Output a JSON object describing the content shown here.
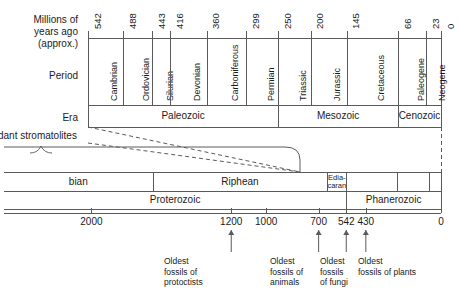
{
  "figure": {
    "type": "geologic-time-scale",
    "axis_label_lines": [
      "Millions of",
      "years ago",
      "(approx.)"
    ],
    "row_labels": {
      "period": "Period",
      "era": "Era"
    },
    "caption_left": "dant stromatolites"
  },
  "phanerozoic_scale": {
    "tick_values": [
      542,
      488,
      443,
      416,
      360,
      299,
      250,
      200,
      145,
      66,
      23,
      0
    ],
    "tick_labels": [
      "542",
      "488",
      "443",
      "416",
      "360",
      "299",
      "250",
      "200",
      "145",
      "66",
      "23",
      "0"
    ],
    "periods": [
      {
        "name": "Cambrian",
        "start": 542,
        "end": 488
      },
      {
        "name": "Ordovician",
        "start": 488,
        "end": 443
      },
      {
        "name": "Silurian",
        "start": 443,
        "end": 416
      },
      {
        "name": "Devonian",
        "start": 416,
        "end": 360
      },
      {
        "name": "Carboniferous",
        "start": 360,
        "end": 299
      },
      {
        "name": "Permian",
        "start": 299,
        "end": 250
      },
      {
        "name": "Triassic",
        "start": 250,
        "end": 200
      },
      {
        "name": "Jurassic",
        "start": 200,
        "end": 145
      },
      {
        "name": "Cretaceous",
        "start": 145,
        "end": 66
      },
      {
        "name": "Paleogene",
        "start": 66,
        "end": 23
      },
      {
        "name": "Neogene",
        "start": 23,
        "end": 0
      }
    ],
    "eras": [
      {
        "name": "Paleozoic",
        "start": 542,
        "end": 250
      },
      {
        "name": "Mesozoic",
        "start": 250,
        "end": 66
      },
      {
        "name": "Cenozoic",
        "start": 66,
        "end": 0
      }
    ]
  },
  "deep_time_scale": {
    "tick_values": [
      2000,
      1200,
      1000,
      700,
      542,
      430,
      0
    ],
    "tick_labels": [
      "2000",
      "1200",
      "1000",
      "700",
      "542",
      "430",
      "0"
    ],
    "upper_units": [
      {
        "name": "bian",
        "start": 2500,
        "end": 1650,
        "truncated": true
      },
      {
        "name": "Riphean",
        "start": 1650,
        "end": 650
      },
      {
        "name": "Edia-caran",
        "line1": "Edia-",
        "line2": "caran",
        "start": 650,
        "end": 542
      },
      {
        "name": "",
        "start": 542,
        "end": 250
      },
      {
        "name": "",
        "start": 250,
        "end": 66
      },
      {
        "name": "",
        "start": 66,
        "end": 0
      }
    ],
    "lower_units": [
      {
        "name": "Proterozoic",
        "start": 2500,
        "end": 542
      },
      {
        "name": "Phanerozoic",
        "start": 542,
        "end": 0
      }
    ]
  },
  "annotations": [
    {
      "value": 1200,
      "lines": [
        "Oldest",
        "fossils of",
        "protoctists"
      ]
    },
    {
      "value": 700,
      "lines": [
        "Oldest",
        "fossils of",
        "animals"
      ]
    },
    {
      "value": 542,
      "lines": [
        "Oldest",
        "fossils",
        "of fungi"
      ]
    },
    {
      "value": 430,
      "lines": [
        "Oldest",
        "fossils of plants"
      ]
    }
  ],
  "colors": {
    "line": "#5a5a5a",
    "text": "#1a1a1a",
    "background": "#ffffff"
  }
}
